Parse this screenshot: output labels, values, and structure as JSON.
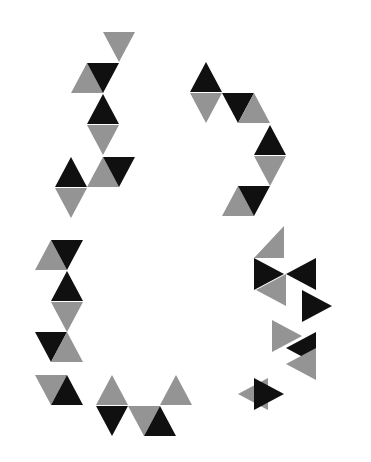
{
  "image": {
    "title": "Abstract triangle glyph composition",
    "width": 371,
    "height": 462,
    "background_color": "#ffffff",
    "description": "Four abstract cluster glyphs built from equilateral triangles in black and gray, arranged in a 2x2 layout on a white field."
  },
  "palette": {
    "black": "#101010",
    "gray": "#949494",
    "white": "#ffffff"
  },
  "geometry": {
    "triangle_width": 32,
    "triangle_height": 30,
    "note": "Equilateral-ish triangles on a half-offset triangular lattice."
  },
  "groups": [
    {
      "id": "glyph-top-left",
      "name": "top-left-glyph",
      "label": "Top left triangle cluster",
      "triangles": [
        {
          "x": 103,
          "y": 32,
          "dir": "down",
          "color": "gray"
        },
        {
          "x": 71,
          "y": 63,
          "dir": "up",
          "color": "gray"
        },
        {
          "x": 87,
          "y": 63,
          "dir": "down",
          "color": "black"
        },
        {
          "x": 87,
          "y": 94,
          "dir": "up",
          "color": "black"
        },
        {
          "x": 87,
          "y": 125,
          "dir": "down",
          "color": "gray"
        },
        {
          "x": 55,
          "y": 157,
          "dir": "up",
          "color": "black"
        },
        {
          "x": 55,
          "y": 188,
          "dir": "down",
          "color": "gray"
        },
        {
          "x": 87,
          "y": 157,
          "dir": "up",
          "color": "gray"
        },
        {
          "x": 103,
          "y": 157,
          "dir": "down",
          "color": "black"
        }
      ]
    },
    {
      "id": "glyph-top-right",
      "name": "top-right-glyph",
      "label": "Top right triangle cluster",
      "triangles": [
        {
          "x": 190,
          "y": 62,
          "dir": "up",
          "color": "black"
        },
        {
          "x": 190,
          "y": 93,
          "dir": "down",
          "color": "gray"
        },
        {
          "x": 222,
          "y": 93,
          "dir": "down",
          "color": "black"
        },
        {
          "x": 238,
          "y": 93,
          "dir": "up",
          "color": "gray"
        },
        {
          "x": 254,
          "y": 125,
          "dir": "up",
          "color": "black"
        },
        {
          "x": 254,
          "y": 156,
          "dir": "down",
          "color": "gray"
        },
        {
          "x": 222,
          "y": 186,
          "dir": "up",
          "color": "gray"
        },
        {
          "x": 238,
          "y": 186,
          "dir": "down",
          "color": "black"
        }
      ]
    },
    {
      "id": "glyph-bottom-left",
      "name": "bottom-left-glyph",
      "label": "Bottom left triangle cluster",
      "triangles": [
        {
          "x": 35,
          "y": 240,
          "dir": "up",
          "color": "gray"
        },
        {
          "x": 51,
          "y": 240,
          "dir": "down",
          "color": "black"
        },
        {
          "x": 51,
          "y": 271,
          "dir": "up",
          "color": "black"
        },
        {
          "x": 51,
          "y": 302,
          "dir": "down",
          "color": "gray"
        },
        {
          "x": 35,
          "y": 332,
          "dir": "down",
          "color": "black"
        },
        {
          "x": 51,
          "y": 332,
          "dir": "up",
          "color": "gray"
        },
        {
          "x": 35,
          "y": 375,
          "dir": "down",
          "color": "gray"
        },
        {
          "x": 51,
          "y": 375,
          "dir": "up",
          "color": "black"
        },
        {
          "x": 96,
          "y": 375,
          "dir": "up",
          "color": "gray"
        },
        {
          "x": 96,
          "y": 406,
          "dir": "down",
          "color": "black"
        },
        {
          "x": 128,
          "y": 406,
          "dir": "down",
          "color": "gray"
        },
        {
          "x": 144,
          "y": 406,
          "dir": "up",
          "color": "black"
        },
        {
          "x": 160,
          "y": 375,
          "dir": "up",
          "color": "gray"
        }
      ]
    },
    {
      "id": "glyph-bottom-right",
      "name": "bottom-right-glyph",
      "label": "Bottom right triangle cluster",
      "triangles": [
        {
          "x": 254,
          "y": 242,
          "dir": "rightup",
          "color": "gray"
        },
        {
          "x": 254,
          "y": 258,
          "dir": "right",
          "color": "black"
        },
        {
          "x": 286,
          "y": 258,
          "dir": "left",
          "color": "black"
        },
        {
          "x": 286,
          "y": 274,
          "dir": "leftdown",
          "color": "gray"
        },
        {
          "x": 302,
          "y": 290,
          "dir": "right",
          "color": "black"
        },
        {
          "x": 302,
          "y": 320,
          "dir": "rightdn",
          "color": "gray"
        },
        {
          "x": 286,
          "y": 332,
          "dir": "left",
          "color": "black"
        },
        {
          "x": 286,
          "y": 348,
          "dir": "leftdn",
          "color": "gray"
        },
        {
          "x": 238,
          "y": 378,
          "dir": "rightlow",
          "color": "gray"
        },
        {
          "x": 254,
          "y": 378,
          "dir": "rightblk",
          "color": "black"
        }
      ]
    }
  ]
}
